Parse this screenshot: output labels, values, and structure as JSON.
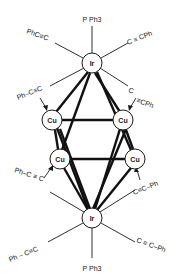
{
  "diagram": {
    "atoms": {
      "ir_top": {
        "label": "Ir",
        "x": 92,
        "y": 63
      },
      "ir_bottom": {
        "label": "Ir",
        "x": 92,
        "y": 218
      },
      "cu_upper_left": {
        "label": "Cu",
        "x": 52,
        "y": 120
      },
      "cu_upper_right": {
        "label": "Cu",
        "x": 123,
        "y": 120
      },
      "cu_lower_left": {
        "label": "Cu",
        "x": 60,
        "y": 159
      },
      "cu_lower_right": {
        "label": "Cu",
        "x": 135,
        "y": 159
      }
    },
    "ligands": {
      "top_pph3": "P Ph3",
      "top_left": "PhC≡C",
      "top_right": "C ≡ CPh",
      "upper_left_bridge": "Ph–C≡C",
      "upper_right_bridge_c": "C",
      "upper_right_bridge_rest": "≡CPh",
      "lower_left_bridge": "Ph–C ≡ C",
      "lower_right_bridge": "C≡C–Ph",
      "bottom_left": "Ph – C≡C",
      "bottom_right": "C ≡ C–Ph",
      "bottom_pph3": "P Ph3"
    }
  }
}
